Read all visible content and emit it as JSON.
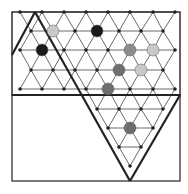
{
  "board": {
    "frame": {
      "x1": 12,
      "y1": 12,
      "x2": 180,
      "y2": 181
    },
    "divider_y": 95,
    "colors": {
      "line": "#444444",
      "thick": "#222222",
      "node": "#222222",
      "black": "#1a1a1a",
      "dark_gray": "#6e6e6e",
      "mid_gray": "#8c8c8c",
      "light_gray": "#c8c8c8"
    },
    "rows": [
      {
        "y": 12,
        "xs": [
          20,
          42,
          64,
          86,
          108,
          130,
          153,
          175
        ]
      },
      {
        "y": 31,
        "xs": [
          31,
          53,
          75,
          97,
          119,
          141,
          163
        ]
      },
      {
        "y": 50,
        "xs": [
          20,
          42,
          64,
          86,
          108,
          130,
          153,
          175
        ]
      },
      {
        "y": 70,
        "xs": [
          31,
          53,
          75,
          97,
          119,
          141,
          163
        ]
      },
      {
        "y": 89,
        "xs": [
          20,
          42,
          64,
          86,
          108,
          130,
          153,
          175
        ]
      },
      {
        "y": 109,
        "xs": [
          97,
          119,
          141,
          163
        ]
      },
      {
        "y": 128,
        "xs": [
          108,
          130,
          153
        ]
      },
      {
        "y": 147,
        "xs": [
          119,
          141
        ]
      },
      {
        "y": 166,
        "xs": [
          130
        ]
      }
    ],
    "pieces": [
      {
        "x": 53,
        "y": 31,
        "color": "light_gray",
        "label": "light-gray-piece"
      },
      {
        "x": 97,
        "y": 31,
        "color": "black",
        "label": "black-piece"
      },
      {
        "x": 42,
        "y": 50,
        "color": "black",
        "label": "black-piece"
      },
      {
        "x": 130,
        "y": 50,
        "color": "mid_gray",
        "label": "gray-piece"
      },
      {
        "x": 153,
        "y": 50,
        "color": "light_gray",
        "label": "light-gray-piece"
      },
      {
        "x": 119,
        "y": 70,
        "color": "dark_gray",
        "label": "dark-gray-piece"
      },
      {
        "x": 141,
        "y": 70,
        "color": "light_gray",
        "label": "light-gray-piece"
      },
      {
        "x": 108,
        "y": 89,
        "color": "dark_gray",
        "label": "dark-gray-piece"
      },
      {
        "x": 130,
        "y": 128,
        "color": "dark_gray",
        "label": "dark-gray-piece"
      }
    ],
    "thick_lines": [
      [
        35,
        12,
        12,
        55
      ],
      [
        35,
        12,
        130,
        181
      ],
      [
        180,
        95,
        130,
        181
      ],
      [
        12,
        95,
        180,
        95
      ]
    ]
  }
}
